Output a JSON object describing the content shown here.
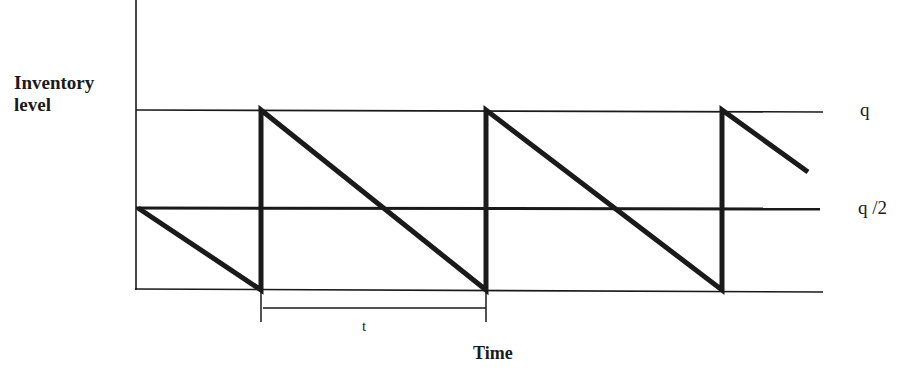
{
  "diagram": {
    "y_axis_label_line1": "Inventory",
    "y_axis_label_line2": "level",
    "x_axis_label": "Time",
    "level_labels": {
      "max": "q",
      "average": "q /2"
    },
    "cycle_label": "t",
    "colors": {
      "line": "#1a1a1a",
      "background": "#ffffff"
    },
    "levels": [
      {
        "name": "max",
        "value": "q"
      },
      {
        "name": "average",
        "value": "q/2"
      },
      {
        "name": "zero",
        "value": "0"
      }
    ],
    "segments": [
      {
        "from": "q/2",
        "to": "0",
        "phase": "partial cycle"
      },
      {
        "from": "q",
        "to": "0",
        "phase": "cycle 1"
      },
      {
        "from": "q",
        "to": "0",
        "phase": "cycle 2"
      },
      {
        "from": "q",
        "to": "approx 0.65q",
        "phase": "cycle 3 (partial)"
      }
    ]
  }
}
